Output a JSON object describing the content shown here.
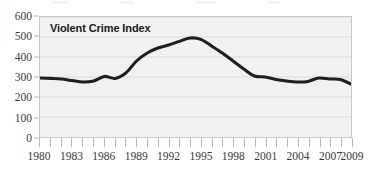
{
  "chart_data": {
    "type": "line",
    "title": "Violent Crime Index",
    "xlabel": "",
    "ylabel": "",
    "xlim": [
      1980,
      2009
    ],
    "ylim": [
      0,
      600
    ],
    "grid": true,
    "legend": "none",
    "y_ticks": [
      600,
      500,
      400,
      300,
      200,
      100,
      0
    ],
    "x_ticks": [
      1980,
      1983,
      1986,
      1989,
      1992,
      1995,
      1998,
      2001,
      2004,
      2007,
      2009
    ],
    "x_minor_ticks": [
      1980,
      1981,
      1982,
      1983,
      1984,
      1985,
      1986,
      1987,
      1988,
      1989,
      1990,
      1991,
      1992,
      1993,
      1994,
      1995,
      1996,
      1997,
      1998,
      1999,
      2000,
      2001,
      2002,
      2003,
      2004,
      2005,
      2006,
      2007,
      2008,
      2009
    ],
    "series": [
      {
        "name": "Violent Crime Index",
        "color": "#1f1f1f",
        "x": [
          1980,
          1981,
          1982,
          1983,
          1984,
          1985,
          1986,
          1987,
          1988,
          1989,
          1990,
          1991,
          1992,
          1993,
          1994,
          1995,
          1996,
          1997,
          1998,
          1999,
          2000,
          2001,
          2002,
          2003,
          2004,
          2005,
          2006,
          2007,
          2008,
          2009
        ],
        "values": [
          295,
          293,
          290,
          282,
          275,
          280,
          303,
          293,
          320,
          380,
          420,
          445,
          460,
          478,
          495,
          488,
          455,
          420,
          380,
          340,
          305,
          300,
          288,
          280,
          275,
          278,
          295,
          290,
          288,
          265
        ]
      }
    ]
  },
  "axes": {
    "y_labels": [
      "600",
      "500",
      "400",
      "300",
      "200",
      "100",
      "0"
    ],
    "x_labels": [
      "1980",
      "1983",
      "1986",
      "1989",
      "1992",
      "1995",
      "1998",
      "2001",
      "2004",
      "2007",
      "2009"
    ]
  },
  "colors": {
    "line": "#1f1f1f",
    "plot_background": "#f1f1f1",
    "plot_border": "#c8c8c8",
    "gridline": "#dcdcdc",
    "tick_text": "#3a3a3a",
    "title_text": "#1a1a1a"
  }
}
